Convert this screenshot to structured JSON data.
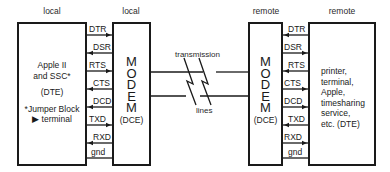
{
  "headers": {
    "local_dte": "local",
    "local_modem": "local",
    "remote_modem": "remote",
    "remote_dte": "remote"
  },
  "local_dte": {
    "lines": [
      "Apple II",
      "and SSC*",
      "",
      "(DTE)",
      "",
      "*Jumper Block",
      "▶ terminal"
    ]
  },
  "local_modem": {
    "letters": [
      "M",
      "O",
      "D",
      "E",
      "M"
    ],
    "role": "(DCE)"
  },
  "remote_modem": {
    "letters": [
      "M",
      "O",
      "D",
      "E",
      "M"
    ],
    "role": "(DCE)"
  },
  "remote_dte": {
    "lines": [
      "printer,",
      "terminal,",
      "Apple,",
      "timesharing",
      "service,",
      "etc. (DTE)"
    ]
  },
  "transmission": {
    "top_label": "transmission",
    "bottom_label": "lines"
  },
  "signals": [
    {
      "name": "DTR",
      "local_dir": "right",
      "remote_dir": "left"
    },
    {
      "name": "DSR",
      "local_dir": "left",
      "remote_dir": "right"
    },
    {
      "name": "RTS",
      "local_dir": "right",
      "remote_dir": "left"
    },
    {
      "name": "CTS",
      "local_dir": "left",
      "remote_dir": "right"
    },
    {
      "name": "DCD",
      "local_dir": "left",
      "remote_dir": "right"
    },
    {
      "name": "TXD",
      "local_dir": "right",
      "remote_dir": "left"
    },
    {
      "name": "RXD",
      "local_dir": "left",
      "remote_dir": "right"
    },
    {
      "name": "gnd",
      "local_dir": "none",
      "remote_dir": "none"
    }
  ]
}
